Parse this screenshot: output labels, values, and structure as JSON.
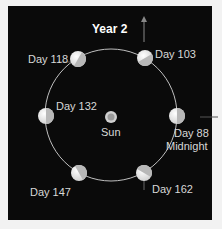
{
  "title": "Year 2",
  "center": {
    "label": "Sun",
    "icon": "sun-icon"
  },
  "planets": [
    {
      "label": "Day 103",
      "icon": "planet-icon"
    },
    {
      "label": "Day 118",
      "icon": "planet-icon"
    },
    {
      "label": "Day 132",
      "icon": "planet-icon"
    },
    {
      "label": "Day 147",
      "icon": "planet-icon"
    },
    {
      "label": "Day 162",
      "icon": "planet-icon"
    },
    {
      "label": "Day 88",
      "sublabel": "Midnight",
      "icon": "planet-icon"
    }
  ],
  "colors": {
    "background": "#0a0a0a",
    "orbit": "#bfbfbf",
    "planet_light": "#f0f0f0",
    "planet_shade": "#b8b8b8"
  }
}
